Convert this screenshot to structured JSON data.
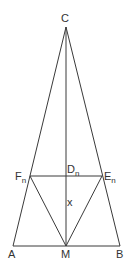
{
  "diagram": {
    "type": "geometry",
    "colors": {
      "line": "#3a3a3a",
      "text": "#333333",
      "background": "#ffffff"
    },
    "points": {
      "C": {
        "label": "C",
        "sub": "",
        "x": 66,
        "y": 27
      },
      "A": {
        "label": "A",
        "sub": "",
        "x": 13,
        "y": 246
      },
      "B": {
        "label": "B",
        "sub": "",
        "x": 120,
        "y": 246
      },
      "M": {
        "label": "M",
        "sub": "",
        "x": 66,
        "y": 246
      },
      "Fn": {
        "label": "F",
        "sub": "n",
        "x": 30,
        "y": 176
      },
      "En": {
        "label": "E",
        "sub": "n",
        "x": 102,
        "y": 176
      },
      "Dn": {
        "label": "D",
        "sub": "n",
        "x": 66,
        "y": 176
      }
    },
    "segments": [
      [
        "C",
        "A"
      ],
      [
        "C",
        "B"
      ],
      [
        "A",
        "B"
      ],
      [
        "C",
        "M"
      ],
      [
        "Fn",
        "En"
      ],
      [
        "Fn",
        "M"
      ],
      [
        "En",
        "M"
      ]
    ],
    "annotations": [
      {
        "text": "x",
        "target": "segment Dn-M"
      }
    ]
  }
}
